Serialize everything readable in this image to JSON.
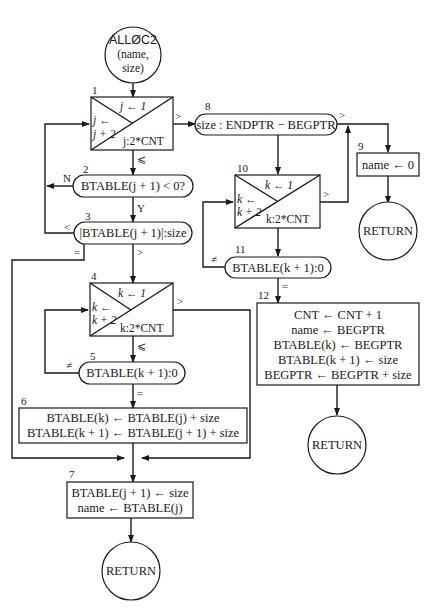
{
  "diagram": {
    "start": {
      "line1": "ALLØC2",
      "line2": "(name,",
      "line3": "size)"
    },
    "box1": {
      "num": "1",
      "init": "j ← 1",
      "inc1": "j ←",
      "inc2": "j + 2",
      "test": "j:2*CNT",
      "exit_gt": ">",
      "exit_le": "⩽"
    },
    "box2": {
      "num": "2",
      "text": "BTABLE(j + 1) < 0?",
      "no": "N",
      "yes": "Y"
    },
    "box3": {
      "num": "3",
      "text": "|BTABLE(j + 1)|:size",
      "lt": "<",
      "eq": "=",
      "gt": ">"
    },
    "box4": {
      "num": "4",
      "init": "k ← 1",
      "inc1": "k ←",
      "inc2": "k + 2",
      "test": "k:2*CNT",
      "exit_gt": ">",
      "exit_le": "⩽"
    },
    "box5": {
      "num": "5",
      "text": "BTABLE(k + 1):0",
      "ne": "≠",
      "eq": "="
    },
    "box6": {
      "num": "6",
      "line1": "BTABLE(k) ← BTABLE(j) + size",
      "line2": "BTABLE(k + 1) ← BTABLE(j + 1) + size"
    },
    "box7": {
      "num": "7",
      "line1": "BTABLE(j + 1) ← size",
      "line2": "name ← BTABLE(j)"
    },
    "return1": "RETURN",
    "box8": {
      "num": "8",
      "text": "size : ENDPTR − BEGPTR",
      "gt": ">"
    },
    "box9": {
      "num": "9",
      "text": "name ← 0"
    },
    "return2": "RETURN",
    "box10": {
      "num": "10",
      "init": "k ← 1",
      "inc1": "k ←",
      "inc2": "k + 2",
      "test": "k:2*CNT",
      "exit_gt": ">"
    },
    "box11": {
      "num": "11",
      "text": "BTABLE(k + 1):0",
      "ne": "≠",
      "eq": "="
    },
    "box12": {
      "num": "12",
      "lines": [
        "CNT ← CNT + 1",
        "name ← BEGPTR",
        "BTABLE(k) ← BEGPTR",
        "BTABLE(k + 1) ← size",
        "BEGPTR ← BEGPTR + size"
      ]
    },
    "return3": "RETURN"
  }
}
